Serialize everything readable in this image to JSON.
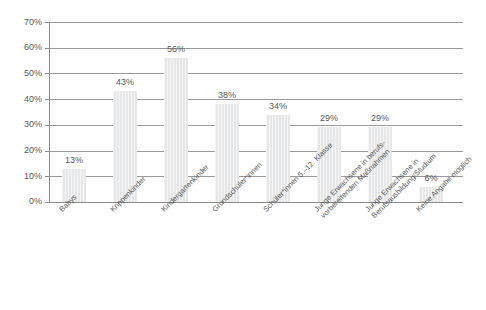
{
  "chart_data": {
    "type": "bar",
    "title": "",
    "subtitle": "",
    "xlabel": "",
    "ylabel": "",
    "ylim": [
      0,
      70
    ],
    "ytick_step": 10,
    "grid": true,
    "legend": false,
    "orientation": "vertical",
    "value_label_suffix": "%",
    "bar_color": "#e6e7e8",
    "grid_color": "#9a9a9a",
    "text_color": "#58595b",
    "categories": [
      "Babys",
      "Krippenkinder",
      "Kindergartenkinder",
      "Grundschüler*innen",
      "Schüler*innen 5.–12. Klasse",
      "Junge Erwachsene in berufs-\nvorbereitenden Maßnahmen",
      "Junge Erwachsene in\nBerufsausbildung/Studium",
      "Keine Angabe möglich"
    ],
    "category_lines": [
      [
        "Babys"
      ],
      [
        "Krippenkinder"
      ],
      [
        "Kindergartenkinder"
      ],
      [
        "Grundschüler*innen"
      ],
      [
        "Schüler*innen 5.–12. Klasse"
      ],
      [
        "Junge Erwachsene in berufs-",
        "vorbereitenden Maßnahmen"
      ],
      [
        "Junge Erwachsene in",
        "Berufsausbildung/Studium"
      ],
      [
        "Keine Angabe möglich"
      ]
    ],
    "values": [
      13,
      43,
      56,
      38,
      34,
      29,
      29,
      6
    ],
    "value_labels": [
      "13%",
      "43%",
      "56%",
      "38%",
      "34%",
      "29%",
      "29%",
      "6%"
    ],
    "ytick_labels": [
      "0%",
      "10%",
      "20%",
      "30%",
      "40%",
      "50%",
      "60%",
      "70%"
    ],
    "ytick_values": [
      0,
      10,
      20,
      30,
      40,
      50,
      60,
      70
    ]
  }
}
